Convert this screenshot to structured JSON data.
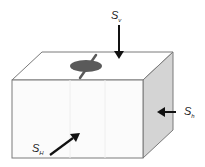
{
  "diagram": {
    "labels": {
      "vertical": {
        "main": "S",
        "sub": "v"
      },
      "min_horizontal": {
        "main": "S",
        "sub": "h"
      },
      "max_horizontal": {
        "main": "S",
        "sub": "H"
      }
    },
    "colors": {
      "outline": "#7a7a7a",
      "front_face": "#fbfbfb",
      "top_face": "#ffffff",
      "side_face": "#d4d4d4",
      "arrow": "#111111",
      "borehole": "#5a5a5a"
    }
  }
}
